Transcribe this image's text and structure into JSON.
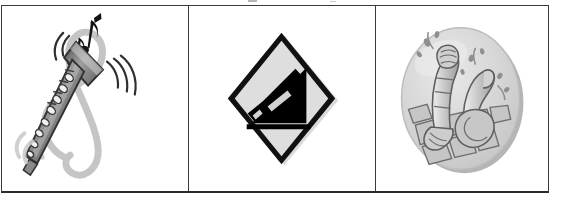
{
  "document": {
    "type": "three-column pictogram table",
    "background_color": "#ffffff",
    "frame_border_color": "#3a3a3a",
    "frame_bottom_border_color": "#2a2a2a"
  },
  "top_artifacts": [
    {
      "name": "cropped-mark-left",
      "color": "#7a7a7a"
    },
    {
      "name": "cropped-mark-right",
      "color": "#7a7a7a"
    }
  ],
  "cells": [
    {
      "index": 1,
      "name": "cell-music",
      "caption": "Clarinet with treble clef and musical notes",
      "subject": "clarinet",
      "icon_name": "clarinet-treble-clef-icon",
      "style": "grayscale clipart",
      "colors": {
        "clef": "#bdbdbd",
        "instrument_body": "#8d8d8d",
        "instrument_outline": "#3f3f3f",
        "keys": "#efefef",
        "notes": "#1a1a1a",
        "motion_lines": "#2e2e2e"
      },
      "elements": [
        "treble-clef",
        "clarinet",
        "eighth-notes",
        "motion-lines"
      ]
    },
    {
      "index": 2,
      "name": "cell-road-sign",
      "caption": "Diamond warning sign: truck on steep descent",
      "subject": "steep hill road sign",
      "icon_name": "steep-descent-diamond-sign-icon",
      "style": "high-contrast black and white",
      "colors": {
        "sign_fill": "#dcdcdc",
        "sign_border": "#0d0d0d",
        "pictogram": "#000000",
        "shadow": "#b8b8b8"
      },
      "elements": [
        "diamond-outline",
        "truck-silhouette",
        "slope"
      ]
    },
    {
      "index": 3,
      "name": "cell-hands",
      "caption": "Hands reaching up from cobblestones inside a gray oval",
      "subject": "hands sinking in pavement",
      "icon_name": "hands-reaching-oval-icon",
      "style": "soft grayscale clipart",
      "colors": {
        "oval_fill": "#d3d3d3",
        "oval_rim": "#b9b9b9",
        "oval_highlight": "#e3e3e3",
        "skin": "#c9c9c9",
        "outline": "#5a5a5a",
        "stones": "#c2c2c2",
        "splash": "#8f8f8f"
      },
      "elements": [
        "oval-plate",
        "left-arm",
        "right-arm",
        "cobblestones",
        "splash-droplets"
      ]
    }
  ]
}
